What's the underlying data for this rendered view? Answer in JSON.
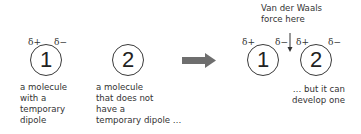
{
  "diagram": {
    "left_panel": {
      "molecule1": {
        "number": "1",
        "delta_plus": "δ+",
        "delta_minus": "δ−",
        "caption": "a molecule\nwith a\ntemporary\ndipole"
      },
      "molecule2": {
        "number": "2",
        "caption": "a molecule\nthat does not\nhave a\ntemporary dipole …"
      }
    },
    "arrow": {
      "icon": "right-arrow-icon",
      "color": "#6e6e6e"
    },
    "right_panel": {
      "force_label": "Van der Waals\nforce here",
      "molecule1": {
        "number": "1",
        "delta_plus": "δ+",
        "delta_minus": "δ−"
      },
      "molecule2": {
        "number": "2",
        "delta_plus": "δ+",
        "delta_minus": "δ−"
      },
      "caption": "… but it can\ndevelop one"
    }
  }
}
